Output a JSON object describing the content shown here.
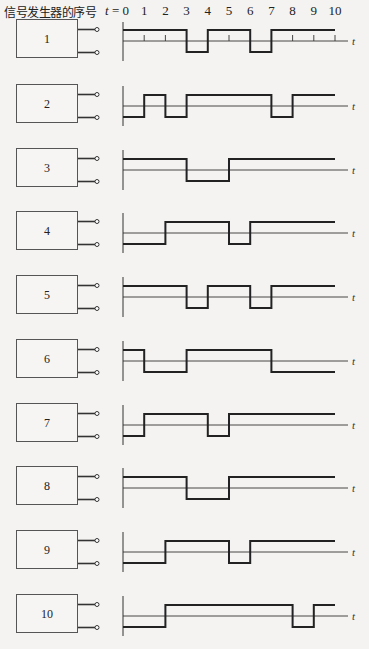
{
  "title": "信号发生器的序号",
  "axis": {
    "t_prefix": "t = 0",
    "tick_labels": [
      "1",
      "2",
      "3",
      "4",
      "5",
      "6",
      "7",
      "8",
      "9",
      "10"
    ],
    "t_symbol": "t"
  },
  "generators": [
    {
      "label": "1",
      "top": 19,
      "start": 1,
      "transitions": [
        3,
        4,
        6,
        7
      ]
    },
    {
      "label": "2",
      "top": 84,
      "start": 0,
      "transitions": [
        1,
        2,
        3,
        7,
        8
      ]
    },
    {
      "label": "3",
      "top": 148,
      "start": 1,
      "transitions": [
        3,
        5
      ]
    },
    {
      "label": "4",
      "top": 211,
      "start": 0,
      "transitions": [
        2,
        5,
        6
      ]
    },
    {
      "label": "5",
      "top": 275,
      "start": 1,
      "transitions": [
        3,
        4,
        6,
        7
      ]
    },
    {
      "label": "6",
      "top": 339,
      "start": 1,
      "transitions": [
        1,
        3,
        7
      ]
    },
    {
      "label": "7",
      "top": 403,
      "start": 0,
      "transitions": [
        1,
        4,
        5
      ]
    },
    {
      "label": "8",
      "top": 466,
      "start": 1,
      "transitions": [
        3,
        5
      ]
    },
    {
      "label": "9",
      "top": 530,
      "start": 0,
      "transitions": [
        2,
        5,
        6
      ]
    },
    {
      "label": "10",
      "top": 594,
      "start": 0,
      "transitions": [
        2,
        8,
        9
      ]
    }
  ],
  "chart_data": {
    "type": "line",
    "title": "信号发生器的序号",
    "xlabel": "t",
    "x_ticks": [
      0,
      1,
      2,
      3,
      4,
      5,
      6,
      7,
      8,
      9,
      10
    ],
    "xlim": [
      0,
      10
    ],
    "series": [
      {
        "name": "1",
        "values": [
          1,
          1,
          1,
          0,
          1,
          1,
          0,
          1,
          1,
          1
        ]
      },
      {
        "name": "2",
        "values": [
          0,
          1,
          0,
          1,
          1,
          1,
          1,
          0,
          1,
          1
        ]
      },
      {
        "name": "3",
        "values": [
          1,
          1,
          1,
          0,
          0,
          1,
          1,
          1,
          1,
          1
        ]
      },
      {
        "name": "4",
        "values": [
          0,
          0,
          1,
          1,
          1,
          0,
          1,
          1,
          1,
          1
        ]
      },
      {
        "name": "5",
        "values": [
          1,
          1,
          1,
          0,
          1,
          1,
          0,
          1,
          1,
          1
        ]
      },
      {
        "name": "6",
        "values": [
          1,
          0,
          0,
          1,
          1,
          1,
          1,
          0,
          0,
          0
        ]
      },
      {
        "name": "7",
        "values": [
          0,
          1,
          1,
          1,
          0,
          1,
          1,
          1,
          1,
          1
        ]
      },
      {
        "name": "8",
        "values": [
          1,
          1,
          1,
          0,
          0,
          1,
          1,
          1,
          1,
          1
        ]
      },
      {
        "name": "9",
        "values": [
          0,
          0,
          1,
          1,
          1,
          0,
          1,
          1,
          1,
          1
        ]
      },
      {
        "name": "10",
        "values": [
          0,
          0,
          1,
          1,
          1,
          1,
          1,
          1,
          0,
          1
        ]
      }
    ],
    "value_note": "values[i] = level on interval [i, i+1]; 1=high, 0=low"
  }
}
